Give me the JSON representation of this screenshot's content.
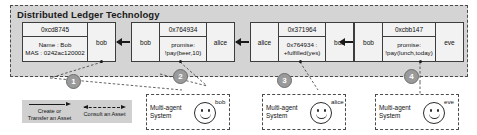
{
  "dlt": {
    "title": "Distributed Ledger Technology",
    "blocks": [
      {
        "left_link": null,
        "hash": "0xcd8745",
        "body_line1": "Name : Bob",
        "body_line2": "MAS : 0242ac120002",
        "right_link": "bob"
      },
      {
        "left_link": "bob",
        "hash": "0x764934",
        "body_line1": "promise:",
        "body_line2": "!pay(beer,10)",
        "right_link": "alice"
      },
      {
        "left_link": "alice",
        "hash": "0x371964",
        "body_line1": "0x764934 :",
        "body_line2": "+fulfilled(yes)",
        "right_link": "bob"
      },
      {
        "left_link": "bob",
        "hash": "0xcbb147",
        "body_line1": "promise:",
        "body_line2": "!pay(lunch,today)",
        "right_link": "eve"
      }
    ]
  },
  "steps": [
    {
      "label": "1"
    },
    {
      "label": "2"
    },
    {
      "label": "3"
    },
    {
      "label": "4"
    }
  ],
  "legend": {
    "items": [
      {
        "text": "Create or\nTransfer an Asset",
        "style": "solid-arrow-right"
      },
      {
        "text": "Consult an Asset",
        "style": "dashed-arrow-both"
      }
    ]
  },
  "mas_boxes": [
    {
      "label": "Multi-agent\nSystem",
      "agent_name": "bob"
    },
    {
      "label": "Multi-agent\nSystem",
      "agent_name": "alice"
    },
    {
      "label": "Multi-agent\nSystem",
      "agent_name": "eve"
    }
  ],
  "colors": {
    "dlt_background": "#d4d4d4",
    "block_background": "#f2f2f2",
    "border": "#3d3d3d",
    "step_circle": "#9a9a9a",
    "legend_background": "#d0d0d0",
    "text": "#101010"
  }
}
